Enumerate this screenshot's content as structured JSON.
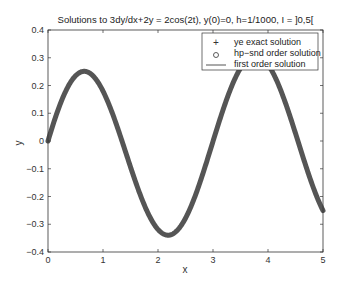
{
  "chart_data": {
    "type": "line",
    "title": "Solutions to 3dy/dx+2y = 2cos(2t), y(0)=0, h=1/1000, I = ]0,5[",
    "xlabel": "x",
    "ylabel": "y",
    "xlim": [
      0,
      5
    ],
    "ylim": [
      -0.4,
      0.4
    ],
    "xticks": [
      "0",
      "1",
      "2",
      "3",
      "4",
      "5"
    ],
    "yticks": [
      "0.4",
      "0.3",
      "0.2",
      "0.1",
      "0",
      "-0.1",
      "-0.2",
      "-0.3",
      "-0.4"
    ],
    "grid": false,
    "legend_position": "upper right",
    "legend": [
      {
        "marker": "+",
        "label": "ye exact solution"
      },
      {
        "marker": "o",
        "label": "hp−snd order solution"
      },
      {
        "marker": "line",
        "label": "first order solution"
      }
    ],
    "x": [
      0,
      0.1,
      0.2,
      0.3,
      0.4,
      0.5,
      0.6,
      0.7,
      0.8,
      0.9,
      1.0,
      1.1,
      1.2,
      1.3,
      1.4,
      1.5,
      1.6,
      1.7,
      1.8,
      1.9,
      2.0,
      2.1,
      2.2,
      2.3,
      2.4,
      2.5,
      2.6,
      2.7,
      2.8,
      2.9,
      3.0,
      3.1,
      3.2,
      3.3,
      3.4,
      3.5,
      3.6,
      3.7,
      3.8,
      3.9,
      4.0,
      4.1,
      4.2,
      4.3,
      4.4,
      4.5,
      4.6,
      4.7,
      4.8,
      4.9,
      5.0
    ],
    "series": [
      {
        "name": "ye exact solution",
        "values": [
          0,
          0.065,
          0.125,
          0.176,
          0.214,
          0.235,
          0.249,
          0.25,
          0.238,
          0.214,
          0.179,
          0.135,
          0.084,
          0.029,
          -0.028,
          -0.085,
          -0.138,
          -0.186,
          -0.244,
          -0.267,
          -0.298,
          -0.322,
          -0.337,
          -0.342,
          -0.337,
          -0.321,
          -0.296,
          -0.262,
          -0.22,
          -0.171,
          -0.117,
          -0.06,
          -0.002,
          0.056,
          0.111,
          0.162,
          0.207,
          0.244,
          0.272,
          0.29,
          0.298,
          0.295,
          0.281,
          0.257,
          0.224,
          0.184,
          0.137,
          0.085,
          0.029,
          -0.028,
          -0.251
        ]
      },
      {
        "name": "hp-snd order solution",
        "values": "same as exact"
      },
      {
        "name": "first order solution",
        "values": "same as exact"
      }
    ],
    "colors": {
      "curve": "#555555",
      "axes": "#333333"
    }
  }
}
